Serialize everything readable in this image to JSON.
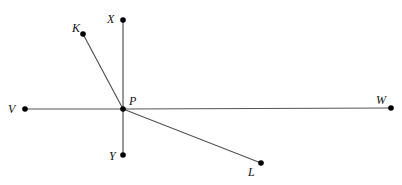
{
  "diagram": {
    "points": [
      {
        "id": "X",
        "label": "X"
      },
      {
        "id": "K",
        "label": "K"
      },
      {
        "id": "P",
        "label": "P"
      },
      {
        "id": "V",
        "label": "V"
      },
      {
        "id": "W",
        "label": "W"
      },
      {
        "id": "Y",
        "label": "Y"
      },
      {
        "id": "L",
        "label": "L"
      }
    ],
    "segments": [
      {
        "from": "P",
        "to": "X"
      },
      {
        "from": "P",
        "to": "K"
      },
      {
        "from": "P",
        "to": "V"
      },
      {
        "from": "P",
        "to": "W"
      },
      {
        "from": "P",
        "to": "Y"
      },
      {
        "from": "P",
        "to": "L"
      }
    ]
  }
}
